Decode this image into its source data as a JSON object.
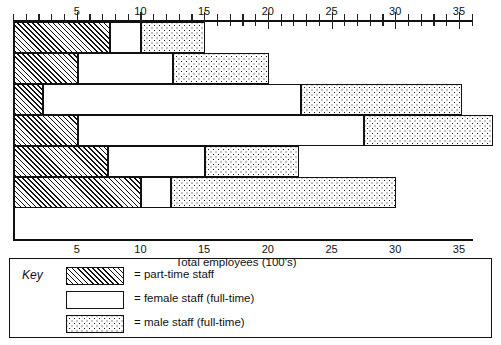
{
  "chart_data": {
    "type": "bar",
    "orientation": "horizontal",
    "stacked": true,
    "title": "",
    "xlabel": "Total employees (100's)",
    "ylabel": "",
    "xlim": [
      0,
      36.5
    ],
    "grid": false,
    "axis_top": true,
    "axis_bottom": true,
    "tick_step_minor": 1,
    "tick_step_major": 5,
    "tick_labels": [
      "5",
      "10",
      "15",
      "20",
      "25",
      "30",
      "35"
    ],
    "tick_values": [
      5,
      10,
      15,
      20,
      25,
      30,
      35
    ],
    "categories": [
      "1",
      "2",
      "3",
      "4",
      "5",
      "6"
    ],
    "series": [
      {
        "name": "part-time staff",
        "pattern": "diagonal-hatch",
        "values": [
          7.5,
          5.0,
          2.3,
          5.0,
          7.4,
          10.0
        ]
      },
      {
        "name": "female staff (full-time)",
        "pattern": "blank-white",
        "values": [
          2.5,
          7.5,
          20.2,
          22.5,
          7.6,
          2.3
        ]
      },
      {
        "name": "male staff (full-time)",
        "pattern": "dotted-stipple",
        "values": [
          5.0,
          7.5,
          12.7,
          10.1,
          7.4,
          17.7
        ]
      }
    ],
    "cumulative_ends": [
      [
        7.5,
        10.0,
        15.0
      ],
      [
        5.0,
        12.5,
        20.0
      ],
      [
        2.3,
        22.5,
        35.2
      ],
      [
        5.0,
        27.5,
        37.6
      ],
      [
        7.4,
        15.0,
        22.4
      ],
      [
        10.0,
        12.3,
        30.0
      ]
    ],
    "totals": [
      15.0,
      20.0,
      35.2,
      37.6,
      22.4,
      30.0
    ]
  },
  "axis": {
    "title": "Total employees (100's)",
    "top_labels": [
      "5",
      "10",
      "15",
      "20",
      "25",
      "30",
      "35"
    ],
    "bottom_labels": [
      "5",
      "10",
      "15",
      "20",
      "25",
      "30",
      "35"
    ]
  },
  "legend": {
    "key_label": "Key",
    "items": [
      {
        "swatch": "hatched-swatch",
        "label": "= part-time staff"
      },
      {
        "swatch": "white-swatch",
        "label": "= female staff (full-time)"
      },
      {
        "swatch": "dotted-swatch",
        "label": "= male staff (full-time)"
      }
    ]
  },
  "colors": {
    "ink": "#111111",
    "paper": "#ffffff"
  }
}
